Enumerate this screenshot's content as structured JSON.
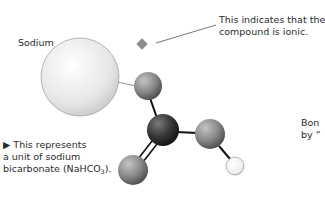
{
  "labels": {
    "sodium": "Sodium",
    "ionic_note_line1": "This indicates that the",
    "ionic_note_line2": "compound is ionic.",
    "caption_marker": "▶",
    "caption_line1": " This represents",
    "caption_line2": "a unit of sodium",
    "caption_line3_pre": "bicarbonate (NaHCO",
    "caption_line3_sub": "3",
    "caption_line3_post": ").",
    "bond_note_line1": "Bon",
    "bond_note_line2": "by “"
  },
  "molecule": {
    "name": "sodium bicarbonate",
    "formula": "NaHCO3",
    "atoms": [
      {
        "id": "sodium",
        "element": "Na",
        "cx": 80,
        "cy": 77,
        "r": 39,
        "color": "#e8e8e8"
      },
      {
        "id": "oxygen-top",
        "element": "O",
        "cx": 148,
        "cy": 86,
        "r": 14,
        "color": "#8a8a8a"
      },
      {
        "id": "carbon",
        "element": "C",
        "cx": 163,
        "cy": 130,
        "r": 16,
        "color": "#3a3a3a"
      },
      {
        "id": "oxygen-right",
        "element": "O",
        "cx": 210,
        "cy": 134,
        "r": 15,
        "color": "#8a8a8a"
      },
      {
        "id": "oxygen-bottom",
        "element": "O",
        "cx": 133,
        "cy": 170,
        "r": 15,
        "color": "#8a8a8a"
      },
      {
        "id": "hydrogen",
        "element": "H",
        "cx": 235,
        "cy": 166,
        "r": 9,
        "color": "#f4f4f4"
      }
    ],
    "bonds": [
      {
        "from": "sodium",
        "to": "oxygen-top",
        "type": "ionic"
      },
      {
        "from": "oxygen-top",
        "to": "carbon",
        "type": "single"
      },
      {
        "from": "carbon",
        "to": "oxygen-right",
        "type": "single"
      },
      {
        "from": "carbon",
        "to": "oxygen-bottom",
        "type": "double"
      },
      {
        "from": "oxygen-right",
        "to": "hydrogen",
        "type": "single"
      }
    ]
  },
  "colors": {
    "marker": "#8c8c8c",
    "text": "#2a2a2a",
    "bond": "#111111",
    "leader_line": "#555555"
  }
}
